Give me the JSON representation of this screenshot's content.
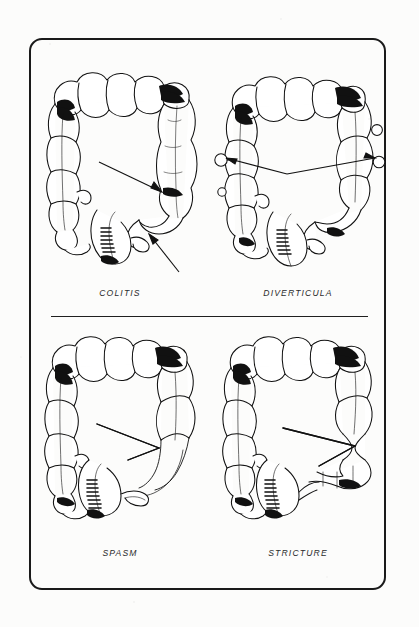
{
  "figure": {
    "kind": "medical-illustration-plate",
    "frame": {
      "border_color": "#1a1a1a",
      "corner_radius_px": 13
    },
    "background_color": "#fcfcfb",
    "ink_color": "#111111"
  },
  "divider": {
    "name": "horizontal-rule-between-rows",
    "color": "#1f1f1f"
  },
  "panels": [
    {
      "id": "colitis",
      "caption": "COLITIS",
      "organ": "large-intestine-colon",
      "row": 1,
      "column": 1,
      "annotations": [
        {
          "type": "arrow",
          "style": "thin-line-with-solid-head",
          "direction": "right-down",
          "points_to": "descending-colon-featureless-lead-pipe-segment"
        },
        {
          "type": "arrow",
          "style": "thin-line-with-solid-head",
          "direction": "left-up",
          "points_to": "sigmoid-colon-narrowed-ulcerated-segment"
        }
      ],
      "features": [
        "loss-of-haustral-markings",
        "lead-pipe-colon",
        "mucosal-ulceration"
      ]
    },
    {
      "id": "diverticula",
      "caption": "DIVERTICULA",
      "organ": "large-intestine-colon",
      "row": 1,
      "column": 2,
      "annotations": [
        {
          "type": "arrow",
          "style": "thin-line-with-solid-head",
          "direction": "left",
          "points_to": "descending-colon-outpouching"
        },
        {
          "type": "arrow",
          "style": "thin-line-with-solid-head",
          "direction": "right",
          "points_to": "ascending-colon-outpouching"
        }
      ],
      "features": [
        "small-rounded-outpouchings",
        "preserved-haustra"
      ]
    },
    {
      "id": "spasm",
      "caption": "SPASM",
      "organ": "large-intestine-colon",
      "row": 2,
      "column": 1,
      "annotations": [
        {
          "type": "arrow",
          "style": "open-v-double-line",
          "direction": "right-down",
          "points_to": "sigmoid-colon-smooth-tapered-narrowing"
        }
      ],
      "features": [
        "smooth-tapering-narrow-sigmoid",
        "transient-functional-narrowing"
      ]
    },
    {
      "id": "stricture",
      "caption": "STRICTURE",
      "organ": "large-intestine-colon",
      "row": 2,
      "column": 2,
      "annotations": [
        {
          "type": "arrow",
          "style": "open-v-double-line",
          "direction": "right-down",
          "points_to": "descending-sigmoid-junction-fixed-narrowing"
        }
      ],
      "features": [
        "short-fixed-narrowed-segment",
        "shouldered-margins"
      ]
    }
  ]
}
